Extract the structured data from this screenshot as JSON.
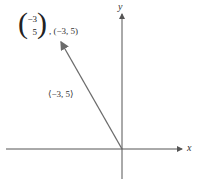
{
  "diagram": {
    "type": "vector-plot",
    "axes": {
      "x_label": "x",
      "y_label": "y"
    },
    "vector": {
      "from": [
        0,
        0
      ],
      "to": [
        -3,
        5
      ],
      "column_vector": {
        "top": "−3",
        "bottom": "5"
      },
      "tip_label": ", (−3, 5)",
      "mid_label": "⟨−3, 5⟩"
    },
    "colors": {
      "vector": "#6b6b6b",
      "axes": "#555555"
    }
  }
}
